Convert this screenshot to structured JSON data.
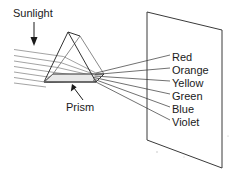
{
  "diagram": {
    "background_color": "#ffffff",
    "ink_color": "#1a1a1a",
    "ray_in_color": "#8c8c8c",
    "ray_out_color": "#4d4d4d",
    "prism_base_fill": "#e8e8e8",
    "labels": {
      "sunlight": "Sunlight",
      "prism": "Prism"
    },
    "spectrum": [
      {
        "name": "Red"
      },
      {
        "name": "Orange"
      },
      {
        "name": "Yellow"
      },
      {
        "name": "Green"
      },
      {
        "name": "Blue"
      },
      {
        "name": "Violet"
      }
    ],
    "icons": {
      "sunlight_arrow": "arrow-down-icon",
      "prism_arrow": "arrow-up-left-icon"
    }
  }
}
